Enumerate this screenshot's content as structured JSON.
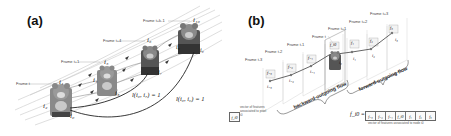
{
  "figure": {
    "panel_a": {
      "label": "(a)",
      "frame_labels": [
        "Frame t",
        "Frame t+1",
        "Frame t+4",
        "Frame t+k-1"
      ],
      "pixel_labels": {
        "i0": "i0",
        "i1": "i1",
        "i2": "i2",
        "i3": "i3",
        "i4": "i4",
        "i5": "i5",
        "i6": "i6",
        "i7": "i7",
        "i8": "i8",
        "i9": "i9",
        "i10": "i10"
      },
      "pixel_display": {
        "i0": "i₀",
        "i1": "i₁",
        "i2": "i₂",
        "i3": "i₃",
        "i4": "i₄",
        "i5": "i₅",
        "i6": "i₆",
        "i7": "i₇",
        "i8": "i₈",
        "i9": "i₉",
        "i10": "i₁₀"
      },
      "equations": [
        "l(i₀, i₇) = 1",
        "l(i₀, i₉) = 1"
      ],
      "content_description": "Four frames of a teddy bear sequence with optical-flow trajectories; pixel i0 in frame t linked to pixels in later frames"
    },
    "panel_b": {
      "label": "(b)",
      "frame_labels": [
        "Frame t-3",
        "Frame t-2",
        "Frame t-1",
        "Frame t",
        "Frame t+1",
        "Frame t+2",
        "Frame t+3"
      ],
      "node_labels": [
        "i₋₃",
        "i₋₂",
        "i₋₁",
        "i₀",
        "i₁",
        "i₂",
        "i₃"
      ],
      "feature_labels": [
        "f₋₃",
        "f₋₂",
        "f₋₁",
        "f_i0",
        "f₁",
        "f₂",
        "f₃"
      ],
      "flow_labels": {
        "backward": "backward-outgoing flow",
        "forward": "forward-outgoing flow"
      },
      "legend": {
        "symbol": "f_i0",
        "text": "vector of features associated to pixel i0"
      },
      "vector": {
        "lhs": "f_i0 =",
        "cells": [
          "f₋₃",
          "f₋₂",
          "f₋₁",
          "f_i0",
          "f₁",
          "f₂",
          "f₃"
        ],
        "caption": "vector of features associated to node i0"
      }
    }
  }
}
